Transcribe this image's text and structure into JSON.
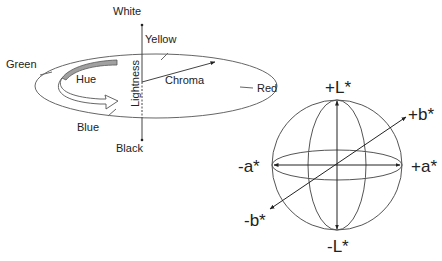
{
  "hue_diagram": {
    "labels": {
      "white": "White",
      "yellow": "Yellow",
      "green": "Green",
      "hue": "Hue",
      "lightness": "Lightness",
      "chroma": "Chroma",
      "red": "Red",
      "blue": "Blue",
      "black": "Black"
    }
  },
  "lab_sphere": {
    "labels": {
      "plus_l": "+L*",
      "minus_l": "-L*",
      "plus_a": "+a*",
      "minus_a": "-a*",
      "plus_b": "+b*",
      "minus_b": "-b*"
    }
  },
  "colors": {
    "stroke": "#555555",
    "text": "#222222",
    "hue_band": "#a0a0a0"
  }
}
